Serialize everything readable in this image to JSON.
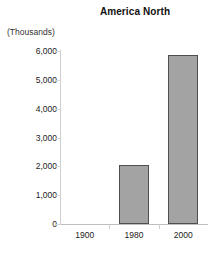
{
  "chart_data": {
    "type": "bar",
    "title": "America North",
    "xlabel": "",
    "ylabel": "(Thousands)",
    "categories": [
      "1900",
      "1980",
      "2000"
    ],
    "values": [
      0,
      2050,
      5850
    ],
    "series": [
      {
        "name": "America North",
        "values": [
          0,
          2050,
          5850
        ]
      }
    ],
    "ylim": [
      0,
      6000
    ],
    "ytick_labels": [
      "0",
      "1,000",
      "2,000",
      "3,000",
      "4,000",
      "5,000",
      "6,000"
    ],
    "ytick_values": [
      0,
      1000,
      2000,
      3000,
      4000,
      5000,
      6000
    ],
    "grid": false,
    "legend": false,
    "legend_position": "none",
    "bar_fill_color": "#a3a3a3",
    "bar_border_color": "#4f4f4f",
    "axis_color": "#c9c9c9",
    "background_color": "#ffffff",
    "text_color": "#222222"
  }
}
